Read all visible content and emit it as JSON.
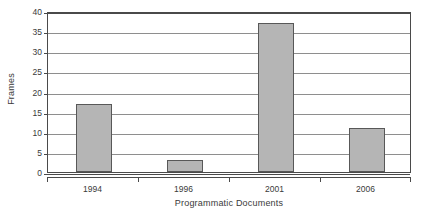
{
  "chart_data": {
    "type": "bar",
    "title": "",
    "categories": [
      "1994",
      "1996",
      "2001",
      "2006"
    ],
    "values": [
      17,
      3,
      37,
      11
    ],
    "series": [
      {
        "name": "Frames",
        "values": [
          17,
          3,
          37,
          11
        ]
      }
    ],
    "xlabel": "Programmatic Documents",
    "ylabel": "Frames",
    "ylim": [
      0,
      40
    ],
    "ytick_values": [
      0,
      5,
      10,
      15,
      20,
      25,
      30,
      35,
      40
    ],
    "ytick_labels": [
      "0",
      "5",
      "10",
      "15",
      "20",
      "25",
      "30",
      "35",
      "40"
    ],
    "grid": true,
    "legend": false,
    "legend_position": "none",
    "colors": {
      "bar_fill": "#b5b5b5",
      "bar_border": "#585858",
      "gridline": "#8e8e8e",
      "axis": "#4a4a4a",
      "text": "#3a3a3a",
      "background": "#ffffff"
    }
  }
}
